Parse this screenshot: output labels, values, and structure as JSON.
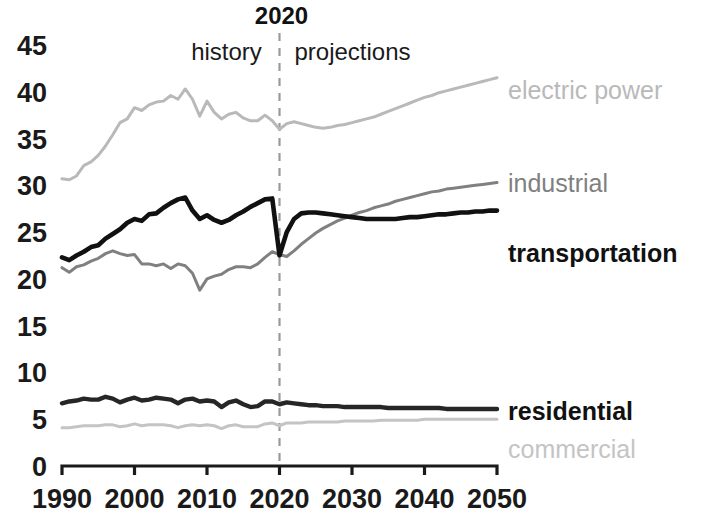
{
  "chart_data": {
    "type": "line",
    "title": "",
    "subtitle": "",
    "xlabel": "",
    "ylabel": "",
    "xlim": [
      1990,
      2050
    ],
    "ylim": [
      0,
      45
    ],
    "grid": false,
    "legend_position": "right-inline",
    "y_ticks": [
      0,
      5,
      10,
      15,
      20,
      25,
      30,
      35,
      40,
      45
    ],
    "y_tick_labels": [
      "0",
      "5",
      "10",
      "15",
      "20",
      "25",
      "30",
      "35",
      "40",
      "45"
    ],
    "x_ticks": [
      1990,
      2000,
      2010,
      2020,
      2030,
      2040,
      2050
    ],
    "x_tick_labels": [
      "1990",
      "2000",
      "2010",
      "2020",
      "2030",
      "2040",
      "2050"
    ],
    "annotations": {
      "divider_year": "2020",
      "left_period": "history",
      "right_period": "projections",
      "divider_x": 2020
    },
    "x": [
      1990,
      1991,
      1992,
      1993,
      1994,
      1995,
      1996,
      1997,
      1998,
      1999,
      2000,
      2001,
      2002,
      2003,
      2004,
      2005,
      2006,
      2007,
      2008,
      2009,
      2010,
      2011,
      2012,
      2013,
      2014,
      2015,
      2016,
      2017,
      2018,
      2019,
      2020,
      2021,
      2022,
      2023,
      2024,
      2025,
      2026,
      2027,
      2028,
      2029,
      2030,
      2031,
      2032,
      2033,
      2034,
      2035,
      2036,
      2037,
      2038,
      2039,
      2040,
      2041,
      2042,
      2043,
      2044,
      2045,
      2046,
      2047,
      2048,
      2049,
      2050
    ],
    "series": [
      {
        "name": "electric power",
        "color": "#b9b9b9",
        "label": "electric power",
        "label_bold": false,
        "label_year": 2050,
        "label_value": 41.0,
        "values": [
          30.7,
          30.6,
          31.0,
          32.1,
          32.5,
          33.2,
          34.2,
          35.4,
          36.7,
          37.1,
          38.3,
          38.0,
          38.6,
          38.9,
          39.0,
          39.6,
          39.2,
          40.3,
          39.2,
          37.4,
          39.0,
          37.8,
          37.1,
          37.6,
          37.8,
          37.2,
          36.9,
          36.9,
          37.5,
          36.9,
          36.0,
          36.6,
          36.8,
          36.6,
          36.4,
          36.2,
          36.1,
          36.2,
          36.4,
          36.5,
          36.7,
          36.9,
          37.1,
          37.3,
          37.6,
          37.9,
          38.2,
          38.5,
          38.8,
          39.1,
          39.4,
          39.6,
          39.9,
          40.1,
          40.3,
          40.5,
          40.7,
          40.9,
          41.1,
          41.3,
          41.5
        ]
      },
      {
        "name": "industrial",
        "color": "#808080",
        "label": "industrial",
        "label_bold": false,
        "label_year": 2050,
        "label_value": 30.3,
        "values": [
          21.2,
          20.7,
          21.3,
          21.5,
          21.9,
          22.2,
          22.7,
          23.0,
          22.7,
          22.5,
          22.6,
          21.6,
          21.6,
          21.4,
          21.6,
          21.1,
          21.6,
          21.4,
          20.6,
          18.8,
          20.0,
          20.3,
          20.5,
          21.0,
          21.3,
          21.3,
          21.2,
          21.6,
          22.3,
          22.9,
          22.6,
          22.4,
          23.0,
          23.7,
          24.3,
          24.9,
          25.4,
          25.8,
          26.2,
          26.5,
          26.8,
          27.1,
          27.3,
          27.6,
          27.8,
          28.0,
          28.3,
          28.5,
          28.7,
          28.9,
          29.1,
          29.3,
          29.4,
          29.6,
          29.7,
          29.8,
          29.9,
          30.0,
          30.1,
          30.2,
          30.3
        ]
      },
      {
        "name": "transportation",
        "color": "#111111",
        "label": "transportation",
        "label_bold": true,
        "label_year": 2050,
        "label_value": 26.0,
        "values": [
          22.3,
          22.0,
          22.5,
          22.9,
          23.4,
          23.6,
          24.3,
          24.8,
          25.3,
          26.0,
          26.4,
          26.2,
          26.9,
          27.0,
          27.6,
          28.1,
          28.5,
          28.7,
          27.3,
          26.4,
          26.8,
          26.3,
          26.0,
          26.3,
          26.8,
          27.2,
          27.7,
          28.1,
          28.5,
          28.6,
          22.5,
          25.0,
          26.4,
          27.0,
          27.1,
          27.1,
          27.0,
          26.9,
          26.8,
          26.7,
          26.6,
          26.5,
          26.4,
          26.4,
          26.4,
          26.4,
          26.4,
          26.5,
          26.6,
          26.6,
          26.7,
          26.8,
          26.9,
          26.9,
          27.0,
          27.1,
          27.1,
          27.2,
          27.2,
          27.3,
          27.3
        ]
      },
      {
        "name": "residential",
        "color": "#262626",
        "label": "residential",
        "label_bold": true,
        "label_year": 2050,
        "label_value": 6.6,
        "values": [
          6.7,
          6.9,
          7.0,
          7.2,
          7.1,
          7.1,
          7.4,
          7.2,
          6.8,
          7.1,
          7.3,
          7.0,
          7.1,
          7.3,
          7.2,
          7.1,
          6.7,
          7.1,
          7.2,
          6.9,
          7.0,
          6.9,
          6.3,
          6.8,
          7.0,
          6.6,
          6.3,
          6.4,
          6.9,
          6.9,
          6.6,
          6.8,
          6.7,
          6.6,
          6.5,
          6.5,
          6.4,
          6.4,
          6.4,
          6.3,
          6.3,
          6.3,
          6.3,
          6.3,
          6.3,
          6.2,
          6.2,
          6.2,
          6.2,
          6.2,
          6.2,
          6.2,
          6.2,
          6.1,
          6.1,
          6.1,
          6.1,
          6.1,
          6.1,
          6.1,
          6.1
        ]
      },
      {
        "name": "commercial",
        "color": "#c4c4c4",
        "label": "commercial",
        "label_bold": false,
        "label_year": 2050,
        "label_value": 4.3,
        "values": [
          4.1,
          4.1,
          4.2,
          4.3,
          4.3,
          4.3,
          4.4,
          4.4,
          4.2,
          4.3,
          4.5,
          4.3,
          4.4,
          4.4,
          4.4,
          4.3,
          4.1,
          4.3,
          4.4,
          4.3,
          4.4,
          4.3,
          4.0,
          4.3,
          4.4,
          4.2,
          4.2,
          4.2,
          4.5,
          4.6,
          4.3,
          4.6,
          4.6,
          4.6,
          4.7,
          4.7,
          4.7,
          4.7,
          4.7,
          4.8,
          4.8,
          4.8,
          4.8,
          4.8,
          4.9,
          4.9,
          4.9,
          4.9,
          4.9,
          4.9,
          5.0,
          5.0,
          5.0,
          5.0,
          5.0,
          5.0,
          5.0,
          5.0,
          5.0,
          5.0,
          5.0
        ]
      }
    ]
  },
  "labels": {
    "electric_power": "electric power",
    "industrial": "industrial",
    "transportation": "transportation",
    "residential": "residential",
    "commercial": "commercial"
  },
  "colors": {
    "electric_power": "#b9b9b9",
    "industrial": "#808080",
    "transportation": "#111111",
    "residential": "#262626",
    "commercial": "#c4c4c4",
    "axis": "#1a1a1a",
    "divider": "#9a9a9a",
    "background": "#ffffff"
  }
}
